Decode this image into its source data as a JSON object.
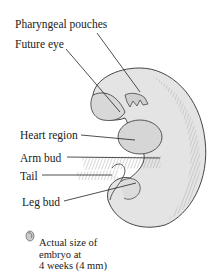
{
  "labels": {
    "pharyngeal_pouches": "Pharyngeal pouches",
    "future_eye": "Future eye",
    "heart_region": "Heart region",
    "arm_bud": "Arm bud",
    "tail": "Tail",
    "leg_bud": "Leg bud"
  },
  "caption": {
    "line1": "Actual size of",
    "line2": "embryo at",
    "line3": "4 weeks (4 mm)"
  },
  "icons": {
    "actual_size": "small-embryo-icon"
  }
}
